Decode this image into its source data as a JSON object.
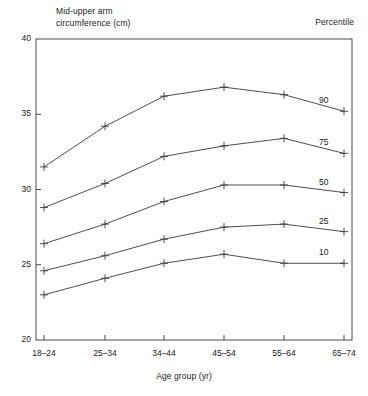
{
  "figure": {
    "y_axis_title": "Mid-upper arm\ncircumference (cm)",
    "x_axis_title": "Age group (yr)",
    "legend_header": "Percentile"
  },
  "chart_data": {
    "type": "line",
    "title": "Mid-upper arm circumference (cm)",
    "xlabel": "Age group (yr)",
    "ylabel": "Mid-upper arm circumference (cm)",
    "categories": [
      "18–24",
      "25–34",
      "34–44",
      "45–54",
      "55–64",
      "65–74"
    ],
    "ylim": [
      20,
      40
    ],
    "yticks": [
      "20",
      "25",
      "30",
      "35",
      "40"
    ],
    "ytick_values": [
      20,
      25,
      30,
      35,
      40
    ],
    "grid": false,
    "legend_position": "right-of-line-ends",
    "legend_title": "Percentile",
    "marker": "plus",
    "series": [
      {
        "name": "90",
        "values": [
          31.5,
          34.2,
          36.2,
          36.8,
          36.3,
          35.2
        ]
      },
      {
        "name": "75",
        "values": [
          28.8,
          30.4,
          32.2,
          32.9,
          33.4,
          32.4
        ]
      },
      {
        "name": "50",
        "values": [
          26.4,
          27.7,
          29.2,
          30.3,
          30.3,
          29.8
        ]
      },
      {
        "name": "25",
        "values": [
          24.6,
          25.6,
          26.7,
          27.5,
          27.7,
          27.2
        ]
      },
      {
        "name": "10",
        "values": [
          23.0,
          24.1,
          25.1,
          25.7,
          25.1,
          25.1
        ]
      }
    ]
  }
}
